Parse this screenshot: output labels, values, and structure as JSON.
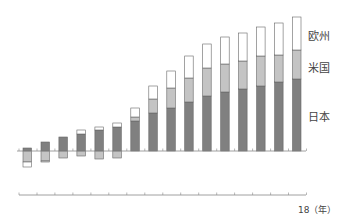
{
  "chart_data": {
    "type": "bar",
    "stacked": true,
    "title": "",
    "xlabel": "（年）",
    "ylabel": "",
    "x_tick_labels_visible": [
      "18"
    ],
    "x_last_label": "18",
    "x_unit": "（年）",
    "categories": [
      "3",
      "4",
      "5",
      "6",
      "7",
      "8",
      "9",
      "10",
      "11",
      "12",
      "13",
      "14",
      "15",
      "16",
      "17",
      "18"
    ],
    "series": [
      {
        "name": "日本",
        "color": "#808080",
        "values": [
          3,
          9,
          14,
          17,
          21,
          24,
          30,
          38,
          43,
          49,
          55,
          59,
          62,
          65,
          69,
          72
        ]
      },
      {
        "name": "米国",
        "color": "#c4c4c4",
        "values": [
          -11,
          -10,
          -7,
          -5,
          -8,
          -7,
          4,
          14,
          20,
          24,
          28,
          28,
          28,
          30,
          27,
          29
        ]
      },
      {
        "name": "欧州",
        "color": "#ffffff",
        "values": [
          -5,
          -1,
          0,
          4,
          3,
          4,
          9,
          13,
          17,
          22,
          24,
          27,
          28,
          29,
          32,
          33
        ]
      }
    ],
    "units": "relative (pixel-estimated, no y-axis shown)",
    "grid": false,
    "legend_position": "right, inline labels"
  },
  "legend": {
    "europe": "欧州",
    "us": "米国",
    "japan": "日本"
  },
  "axis": {
    "end_label": "18（年）"
  }
}
